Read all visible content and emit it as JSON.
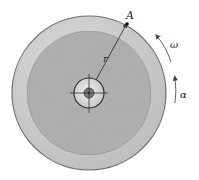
{
  "diagram": {
    "labels": {
      "point": "A",
      "radius": "r",
      "angular_velocity": "ω",
      "angular_acceleration": "α"
    },
    "colors": {
      "outer_ring": "#cbcbcb",
      "inner_disc": "#b3b3b3",
      "rim": "#6e6e6e",
      "line": "#333333"
    }
  }
}
